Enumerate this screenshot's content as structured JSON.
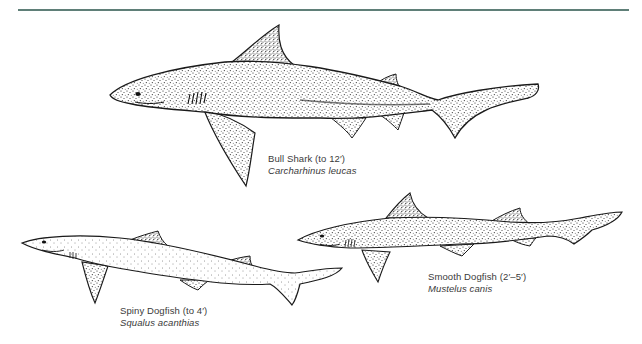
{
  "page": {
    "rule_color": "#5f7f78",
    "ink_color": "#1a1a1a"
  },
  "figures": [
    {
      "id": "bull-shark",
      "common_name": "Bull Shark (to 12′)",
      "scientific_name": "Carcharhinus leucas"
    },
    {
      "id": "spiny-dogfish",
      "common_name": "Spiny Dogfish (to 4′)",
      "scientific_name": "Squalus acanthias"
    },
    {
      "id": "smooth-dogfish",
      "common_name": "Smooth Dogfish (2′–5′)",
      "scientific_name": "Mustelus canis"
    }
  ]
}
